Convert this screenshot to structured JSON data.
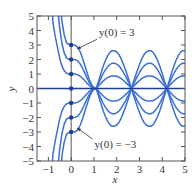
{
  "chart_data": {
    "type": "line",
    "title": "",
    "xlabel": "x",
    "ylabel": "y",
    "xlim": [
      -1.5,
      5
    ],
    "ylim": [
      -5,
      5
    ],
    "grid": false,
    "x_ticks": [
      -1,
      0,
      1,
      2,
      3,
      4,
      5
    ],
    "x_tick_labels": [
      "−1",
      "0",
      "1",
      "2",
      "3",
      "4",
      "5"
    ],
    "y_ticks": [
      -5,
      -4,
      -3,
      -2,
      -1,
      0,
      1,
      2,
      3,
      4,
      5
    ],
    "y_tick_labels": [
      "−5",
      "−4",
      "−3",
      "−2",
      "−1",
      "0",
      "1",
      "2",
      "3",
      "4",
      "5"
    ],
    "curve_color": "#3a6fd8",
    "axis_color": "#1d3f8f",
    "frame_color": "#555555",
    "initial_values": [
      3,
      2,
      1,
      0,
      -1,
      -2,
      -3
    ],
    "x": [
      -1.0,
      -0.9,
      -0.8,
      -0.7,
      -0.6,
      -0.5,
      -0.4,
      -0.3,
      -0.2,
      -0.1,
      0.0,
      0.1,
      0.2,
      0.3,
      0.4,
      0.5,
      0.6,
      0.7,
      0.8,
      0.9,
      1.0,
      1.1,
      1.2,
      1.3,
      1.4,
      1.5,
      1.6,
      1.7,
      1.8,
      1.9,
      2.0,
      2.1,
      2.2,
      2.3,
      2.4,
      2.5,
      2.6,
      2.65,
      2.7,
      2.8,
      2.9,
      3.0,
      3.1,
      3.2,
      3.3,
      3.4,
      3.5,
      3.6,
      3.7,
      3.8,
      3.9,
      4.0,
      4.1,
      4.2,
      4.3,
      4.4,
      4.5,
      4.6,
      4.7,
      4.8,
      4.9,
      5.0
    ],
    "unit_solution": [
      11.6,
      7.01,
      4.57,
      3.61,
      2.84,
      2.06,
      1.54,
      1.22,
      1.05,
      1.01,
      1.0,
      1.0,
      0.99,
      0.94,
      0.84,
      0.7,
      0.53,
      0.36,
      0.2,
      0.09,
      0.02,
      0.0,
      -0.17,
      -0.34,
      -0.5,
      -0.64,
      -0.75,
      -0.83,
      -0.87,
      -0.87,
      -0.84,
      -0.78,
      -0.68,
      -0.55,
      -0.41,
      -0.25,
      -0.08,
      0.0,
      0.09,
      0.25,
      0.41,
      0.55,
      0.68,
      0.78,
      0.84,
      0.87,
      0.87,
      0.83,
      0.75,
      0.64,
      0.5,
      0.34,
      0.17,
      0.0,
      -0.17,
      -0.34,
      -0.5,
      -0.64,
      -0.75,
      -0.83,
      -0.87,
      -0.87
    ],
    "series": [
      {
        "name": "y(0) = 3",
        "y0": 3
      },
      {
        "name": "y(0) = 2",
        "y0": 2
      },
      {
        "name": "y(0) = 1",
        "y0": 1
      },
      {
        "name": "y(0) = 0",
        "y0": 0
      },
      {
        "name": "y(0) = -1",
        "y0": -1
      },
      {
        "name": "y(0) = -2",
        "y0": -2
      },
      {
        "name": "y(0) = -3",
        "y0": -3
      }
    ],
    "annotations": [
      {
        "text": "y(0) = 3",
        "point": [
          0,
          3
        ],
        "label_at": [
          1.4,
          3.6
        ]
      },
      {
        "text": "y(0) = −3",
        "point": [
          0,
          -3
        ],
        "label_at": [
          1.2,
          -4.1
        ]
      }
    ],
    "marked_points": [
      [
        0,
        3
      ],
      [
        0,
        2
      ],
      [
        0,
        1
      ],
      [
        0,
        0
      ],
      [
        0,
        -1
      ],
      [
        0,
        -2
      ],
      [
        0,
        -3
      ]
    ]
  }
}
